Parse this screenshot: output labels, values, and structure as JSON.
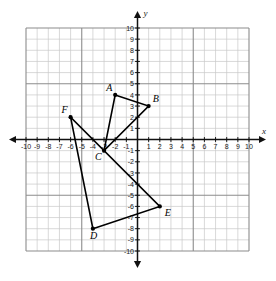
{
  "chart_data": {
    "type": "scatter",
    "title": "",
    "xlabel": "x",
    "ylabel": "y",
    "xlim": [
      -10,
      10
    ],
    "ylim": [
      -10,
      10
    ],
    "grid": true,
    "legend": "none",
    "x_ticks": [
      -10,
      -9,
      -8,
      -7,
      -6,
      -5,
      -4,
      -3,
      -2,
      -1,
      1,
      2,
      3,
      4,
      5,
      6,
      7,
      8,
      9,
      10
    ],
    "y_ticks": [
      10,
      9,
      8,
      7,
      6,
      5,
      4,
      3,
      2,
      1,
      -1,
      -2,
      -3,
      -4,
      -5,
      -6,
      -7,
      -8,
      -9,
      -10
    ],
    "x_tick_labels": [
      "-10",
      "-9",
      "-8",
      "-7",
      "-6",
      "-5",
      "-4",
      "-3",
      "-2",
      "-1",
      "1",
      "2",
      "3",
      "4",
      "5",
      "6",
      "7",
      "8",
      "9",
      "10"
    ],
    "y_tick_labels": [
      "10",
      "9",
      "8",
      "7",
      "6",
      "5",
      "4",
      "3",
      "2",
      "1",
      "-1",
      "-2",
      "-3",
      "-4",
      "-5",
      "-6",
      "-7",
      "-8",
      "-9",
      "-10"
    ],
    "points": [
      {
        "label": "A",
        "x": -2,
        "y": 4,
        "label_dx": -9,
        "label_dy": -4
      },
      {
        "label": "B",
        "x": 1,
        "y": 3,
        "label_dx": 4,
        "label_dy": -4
      },
      {
        "label": "C",
        "x": -3,
        "y": -1,
        "label_dx": -9,
        "label_dy": 9
      },
      {
        "label": "D",
        "x": -4,
        "y": -8,
        "label_dx": -3,
        "label_dy": 10
      },
      {
        "label": "E",
        "x": 2,
        "y": -6,
        "label_dx": 5,
        "label_dy": 10
      },
      {
        "label": "F",
        "x": -6,
        "y": 2,
        "label_dx": -9,
        "label_dy": -4
      }
    ],
    "shapes": [
      {
        "name": "triangle-abc",
        "vertices": [
          "A",
          "B",
          "C"
        ]
      },
      {
        "name": "triangle-def",
        "vertices": [
          "D",
          "E",
          "F"
        ]
      }
    ],
    "colors": {
      "grid_minor": "#c8c8c8",
      "grid_major": "#8c8c8c",
      "axis": "#111111",
      "segment": "#000000",
      "point": "#000000",
      "background": "#ffffff"
    }
  }
}
